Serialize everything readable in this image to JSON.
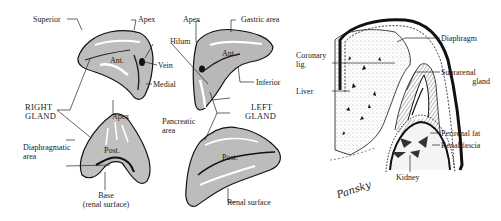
{
  "figure": {
    "left_panel": {
      "right_gland": {
        "title_line1": "RIGHT",
        "title_line2": "GLAND",
        "anterior_view": {
          "surface_label": "Ant.",
          "labels": [
            "Superior",
            "Apex",
            "Vein",
            "Medial"
          ]
        },
        "posterior_view": {
          "surface_label": "Post.",
          "labels": [
            "Apex",
            "Diaphragmatic area",
            "Base (renal surface)"
          ],
          "diaphragmatic_line1": "Diaphragmatic",
          "diaphragmatic_line2": "area",
          "base_line1": "Base",
          "base_line2": "(renal surface)"
        }
      },
      "hilum_label": "Hilum",
      "left_gland": {
        "title_line1": "LEFT",
        "title_line2": "GLAND",
        "anterior_view": {
          "surface_label": "Ant.",
          "labels": [
            "Apex",
            "Gastric area",
            "Inferior",
            "Pancreatic area"
          ],
          "pancreatic_line1": "Pancreatic",
          "pancreatic_line2": "area"
        },
        "posterior_view": {
          "surface_label": "Post.",
          "labels": [
            "Renal surface"
          ]
        }
      }
    },
    "right_panel": {
      "labels": {
        "coronary_line1": "Coronary",
        "coronary_line2": "lig.",
        "liver": "Liver",
        "diaphragm": "Diaphragm",
        "suprarenal_line1": "Suprarenal",
        "suprarenal_line2": "gland",
        "perirenal_fat": "Perirenal fat",
        "renal_fascia": "Renal fascia",
        "kidney": "Kidney"
      }
    },
    "signature": "Pansky"
  }
}
